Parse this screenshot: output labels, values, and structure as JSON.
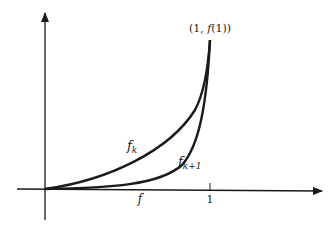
{
  "diagram": {
    "point_label": {
      "prefix": "(1, ",
      "fn": "f",
      "suffix": "(1))"
    },
    "curves": [
      {
        "name": "f_k",
        "base": "f",
        "sub": "k"
      },
      {
        "name": "f_k+1",
        "base": "f",
        "sub": "k+1"
      }
    ],
    "x_ticks": [
      {
        "label": "f",
        "italic": true
      },
      {
        "label": "1",
        "italic": false
      }
    ],
    "colors": {
      "stroke": "#1a1a1a",
      "background": "#ffffff"
    }
  }
}
